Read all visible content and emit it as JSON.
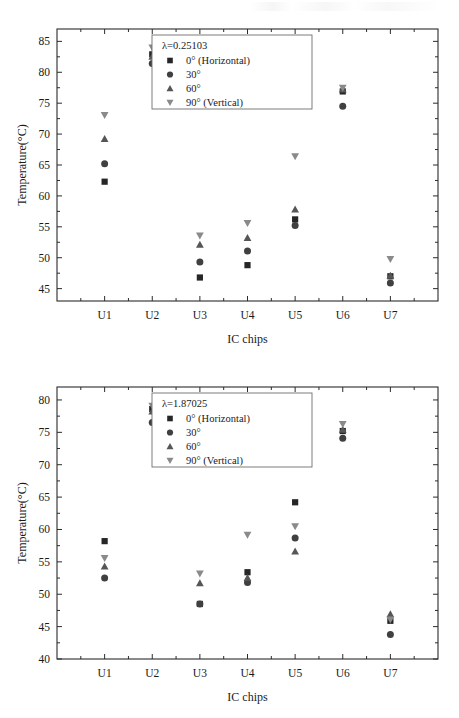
{
  "figure": {
    "background_color": "#ffffff",
    "axis_color": "#2b2b2b",
    "width": 459,
    "height": 718
  },
  "series_styles": [
    {
      "key": "deg0",
      "marker": "square",
      "color": "#262626"
    },
    {
      "key": "deg30",
      "marker": "circle",
      "color": "#404040"
    },
    {
      "key": "deg60",
      "marker": "triangle-up",
      "color": "#565656"
    },
    {
      "key": "deg90",
      "marker": "triangle-down",
      "color": "#8a8a8a"
    }
  ],
  "charts": [
    {
      "id": "chart-top",
      "legend_title": "λ=0.25103",
      "legend_position": "top-center",
      "chart_data": {
        "type": "scatter",
        "title": "",
        "xlabel": "IC chips",
        "ylabel": "Temperature(°C)",
        "categories": [
          "U1",
          "U2",
          "U3",
          "U4",
          "U5",
          "U6",
          "U7"
        ],
        "ylim": [
          43,
          87
        ],
        "yticks": [
          45,
          50,
          55,
          60,
          65,
          70,
          75,
          80,
          85
        ],
        "ytick_labels": [
          "45",
          "50",
          "55",
          "60",
          "65",
          "70",
          "75",
          "80",
          "85"
        ],
        "grid": false,
        "series": [
          {
            "name": "0°  (Horizontal)",
            "marker": "square",
            "values": [
              62.3,
              82.9,
              46.8,
              48.8,
              56.2,
              76.9,
              47.0
            ]
          },
          {
            "name": "30°",
            "marker": "circle",
            "values": [
              65.2,
              81.4,
              49.3,
              51.1,
              55.2,
              74.5,
              45.9
            ]
          },
          {
            "name": "60°",
            "marker": "triangle-up",
            "values": [
              69.2,
              82.5,
              52.1,
              53.2,
              57.8,
              77.2,
              47.1
            ]
          },
          {
            "name": "90° (Vertical)",
            "marker": "triangle-down",
            "values": [
              73.1,
              84.0,
              53.6,
              55.6,
              66.4,
              77.5,
              49.8
            ]
          }
        ]
      }
    },
    {
      "id": "chart-bottom",
      "legend_title": "λ=1.87025",
      "legend_position": "top-center",
      "chart_data": {
        "type": "scatter",
        "title": "",
        "xlabel": "IC chips",
        "ylabel": "Temperature(°C)",
        "categories": [
          "U1",
          "U2",
          "U3",
          "U4",
          "U5",
          "U6",
          "U7"
        ],
        "ylim": [
          40,
          82
        ],
        "yticks": [
          40,
          45,
          50,
          55,
          60,
          65,
          70,
          75,
          80
        ],
        "ytick_labels": [
          "40",
          "45",
          "50",
          "55",
          "60",
          "65",
          "70",
          "75",
          "80"
        ],
        "grid": false,
        "series": [
          {
            "name": "0°  (Horizontal)",
            "marker": "square",
            "values": [
              58.2,
              78.6,
              48.5,
              53.4,
              64.2,
              75.2,
              45.9
            ]
          },
          {
            "name": "30°",
            "marker": "circle",
            "values": [
              52.5,
              76.5,
              48.5,
              51.8,
              58.7,
              74.1,
              43.8
            ]
          },
          {
            "name": "60°",
            "marker": "triangle-up",
            "values": [
              54.3,
              78.2,
              51.7,
              52.5,
              56.6,
              75.4,
              46.9
            ]
          },
          {
            "name": "90° (Vertical)",
            "marker": "triangle-down",
            "values": [
              55.6,
              79.1,
              53.2,
              59.2,
              60.5,
              76.3,
              46.1
            ]
          }
        ]
      }
    }
  ]
}
